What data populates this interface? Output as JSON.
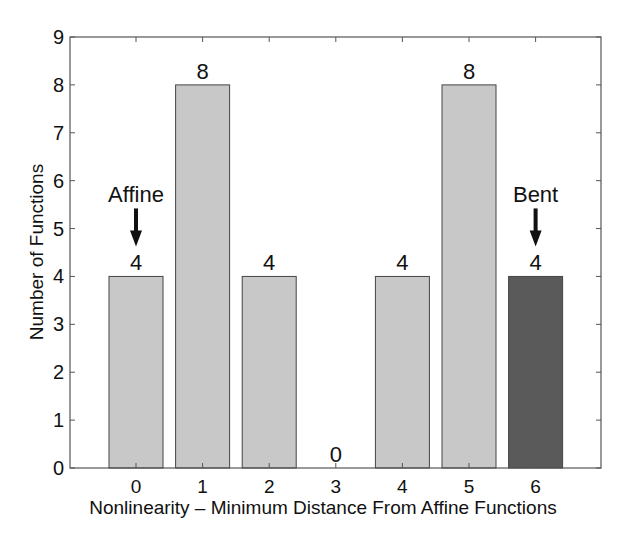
{
  "chart_data": {
    "type": "bar",
    "title": "",
    "xlabel": "Nonlinearity – Minimum Distance From Affine Functions",
    "ylabel": "Number of Functions",
    "categories": [
      "0",
      "1",
      "2",
      "3",
      "4",
      "5",
      "6"
    ],
    "values": [
      4,
      8,
      4,
      0,
      4,
      8,
      4
    ],
    "value_labels": [
      "4",
      "8",
      "4",
      "0",
      "4",
      "8",
      "4"
    ],
    "ylim": [
      0,
      9
    ],
    "yticks": [
      "0",
      "1",
      "2",
      "3",
      "4",
      "5",
      "6",
      "7",
      "8",
      "9"
    ],
    "grid": false,
    "legend": null,
    "bar_colors": [
      "#c8c8c8",
      "#c8c8c8",
      "#c8c8c8",
      "#c8c8c8",
      "#c8c8c8",
      "#c8c8c8",
      "#5a5a5a"
    ],
    "annotations": [
      {
        "text": "Affine",
        "category": "0",
        "arrow": "down"
      },
      {
        "text": "Bent",
        "category": "6",
        "arrow": "down"
      }
    ]
  },
  "colors": {
    "bar_light": "#c8c8c8",
    "bar_dark": "#5a5a5a",
    "axis": "#555555",
    "bar_edge": "#444444"
  }
}
